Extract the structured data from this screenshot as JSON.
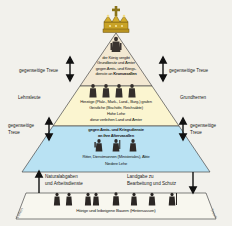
{
  "diagram": {
    "colors": {
      "background": "#f2f1ec",
      "top_tier": "#f6ead2",
      "upper_tier": "#fbf4cf",
      "middle_tier": "#bfe4f2",
      "bottom_tier": "#f7f6ee",
      "outline": "#3a3a3a",
      "crown_gold": "#c8a225"
    },
    "tiers": [
      {
        "id": "king",
        "name": "king-tier",
        "lines": [
          {
            "text": "der König vergibt",
            "bold": false
          },
          {
            "text": "Grundbesitz und Ämter",
            "bold": false
          },
          {
            "text": "gegen Amts- und Kriegs-",
            "bold": false
          },
          {
            "text": "dienste an Kronvasallen",
            "bold": false,
            "bold_tail": "Kronvasallen"
          }
        ]
      },
      {
        "id": "nobility",
        "name": "nobility-tier",
        "lines": [
          {
            "text": "Herzöge (Pfalz-, Mark-, Land-, Burg-) grafen",
            "bold": false
          },
          {
            "text": "Geistliche (Bischöfe, Reichsäbte)",
            "bold": false
          },
          {
            "text": "Hohe Lehe",
            "bold": false
          },
          {
            "text": "diese verleihen Land und Ämter",
            "bold": false
          }
        ]
      },
      {
        "id": "vassals",
        "name": "vassals-tier",
        "lines": [
          {
            "text": "gegen Amts- und Kriegsdienste",
            "bold": false
          },
          {
            "text": "an ihre Aftervasallen",
            "bold": false,
            "bold_tail": "Aftervasallen"
          },
          {
            "text": "Ritter, Dienstmannen (Ministeriales), Äbte",
            "bold": false
          },
          {
            "text": "Niedere Lehe",
            "bold": false
          }
        ]
      },
      {
        "id": "peasants",
        "name": "peasants-tier",
        "lines": [
          {
            "text": "Hörige und leibeigene Bauern (Hintersassen)",
            "bold": false
          }
        ]
      }
    ],
    "king_text": {
      "line1": "der König vergibt",
      "line2": "Grundbesitz und Ämter",
      "line3": "gegen Amts- und Kriegs-",
      "line4_prefix": "dienste an ",
      "line4_bold": "Kronvasallen"
    },
    "nobility_text": {
      "line1": "Herzöge (Pfalz-, Mark-, Land-, Burg-) grafen",
      "line2": "Geistliche (Bischöfe, Reichsäbte)",
      "line3": "Hohe Lehe",
      "line4": "diese verleihen Land und Ämter"
    },
    "vassal_text": {
      "line1": "gegen Amts- und Kriegsdienste",
      "line2_prefix": "an ihre ",
      "line2_bold": "Aftervasallen",
      "line3": "Ritter, Dienstmannen (Ministeriales), Äbte",
      "line4": "Niedere Lehe"
    },
    "peasant_text": {
      "line1": "Hörige und leibeigene Bauern (Hintersassen)"
    },
    "side_labels": {
      "left_top": "gegenseitige Treue",
      "left_mid_role": "Lehnsleute",
      "left_lower_1": "gegenseitige",
      "left_lower_2": "Treue",
      "right_top": "gegenseitige Treue",
      "right_mid_role": "Grundherren",
      "right_lower_1": "gegenseitige",
      "right_lower_2": "Treue"
    },
    "bottom_labels": {
      "left_line1": "Naturalabgaben",
      "left_line2": "und Arbeitsdienste",
      "right_line1": "Landgabe zu",
      "right_line2": "Bearbeitung und Schutz",
      "diag_left": "Lehen",
      "diag_right": "Treue"
    },
    "icons": {
      "crown": "crown-icon",
      "cross": "cross-icon",
      "king_figure": "king-figure-icon",
      "noble_figure": "noble-figure-icon",
      "knight_figure": "knight-figure-icon",
      "peasant_figure": "peasant-figure-icon",
      "arrow_up_down": "double-arrow-icon",
      "arrow_up": "arrow-up-icon",
      "arrow_down": "arrow-down-icon"
    }
  }
}
